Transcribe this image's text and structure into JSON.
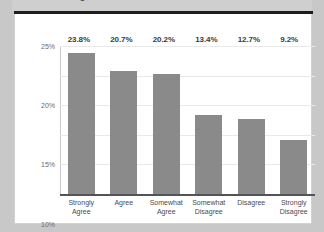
{
  "title": "All College Graduates",
  "chart_data": {
    "type": "bar",
    "title": "All College Graduates",
    "xlabel": "",
    "ylabel": "",
    "categories": [
      "Strongly Agree",
      "Agree",
      "Somewhat Agree",
      "Somewhat Disagree",
      "Disagree",
      "Strongly Disagree"
    ],
    "category_lines": [
      [
        "Strongly",
        "Agree"
      ],
      [
        "Agree",
        ""
      ],
      [
        "Somewhat",
        "Agree"
      ],
      [
        "Somewhat",
        "Disagree"
      ],
      [
        "Disagree",
        ""
      ],
      [
        "Strongly",
        "Disagree"
      ]
    ],
    "values": [
      23.8,
      20.7,
      20.2,
      13.4,
      12.7,
      9.2
    ],
    "data_labels": [
      "23.8%",
      "20.7%",
      "20.2%",
      "13.4%",
      "12.7%",
      "9.2%"
    ],
    "ylim": [
      0,
      25
    ],
    "yticks": [
      0,
      5,
      10,
      15,
      20,
      25
    ],
    "ytick_labels": [
      "0%",
      "5%",
      "10%",
      "15%",
      "20%",
      "25%"
    ],
    "grid": true,
    "legend": false,
    "bar_color": "#8a8a8a"
  }
}
